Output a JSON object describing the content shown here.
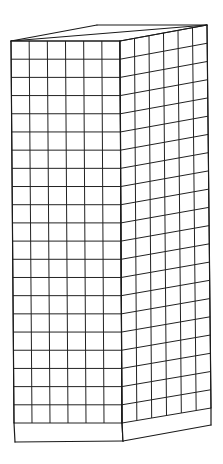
{
  "figure": {
    "canvas": {
      "width": 223,
      "height": 464,
      "background": "#ffffff"
    },
    "stroke_color": "#1a1a1a",
    "top_face": {
      "front_left": [
        11,
        41
      ],
      "front_right": [
        120,
        41
      ],
      "back_right": [
        207,
        25
      ],
      "back_left": [
        97,
        25
      ]
    },
    "front_face": {
      "top_left": [
        11,
        41
      ],
      "top_right": [
        120,
        41
      ],
      "grid_bottom_left": [
        14,
        423
      ],
      "grid_bottom_right": [
        122,
        423
      ],
      "bottom_left": [
        15,
        442
      ],
      "bottom_right": [
        123,
        441
      ],
      "columns": 6,
      "rows": 21
    },
    "right_face": {
      "top_left": [
        120,
        41
      ],
      "top_right": [
        207,
        25
      ],
      "grid_bottom_left": [
        122,
        423
      ],
      "grid_bottom_right": [
        211,
        408
      ],
      "bottom_left": [
        123,
        441
      ],
      "bottom_right": [
        211,
        425
      ],
      "columns": 6,
      "rows": 21
    }
  }
}
